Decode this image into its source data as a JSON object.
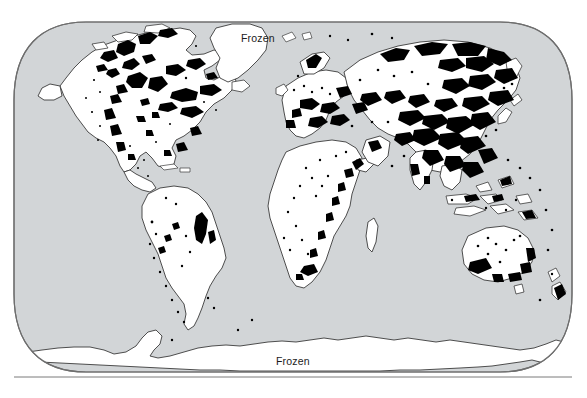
{
  "figure": {
    "type": "world-map",
    "projection": "robinson",
    "title": "",
    "caption": ""
  },
  "labels": {
    "arctic": "Frozen",
    "antarctic": "Frozen"
  },
  "legend": {
    "visible": false,
    "entries": []
  },
  "colors": {
    "ocean": "#d2d5d7",
    "land": "#ffffff",
    "highlight": "#000000",
    "outline": "#3b3b3b",
    "frame": "#6e6e6e",
    "rule": "#7a7a7a",
    "background": "#ffffff",
    "label_text": "#1b1b1b"
  },
  "geometry": {
    "frame_left": 14,
    "frame_right": 572,
    "frame_top": 22,
    "frame_bottom": 372,
    "corner_radius": 72,
    "rule_y": 377,
    "rule_x1": 14,
    "rule_x2": 572
  },
  "landmasses": [
    "north-america",
    "greenland",
    "south-america",
    "africa",
    "europe",
    "asia",
    "australia",
    "new-zealand",
    "madagascar",
    "antarctica",
    "islands"
  ],
  "label_positions": {
    "arctic": {
      "x": 241,
      "y": 39
    },
    "antarctic": {
      "x": 293,
      "y": 362
    }
  }
}
